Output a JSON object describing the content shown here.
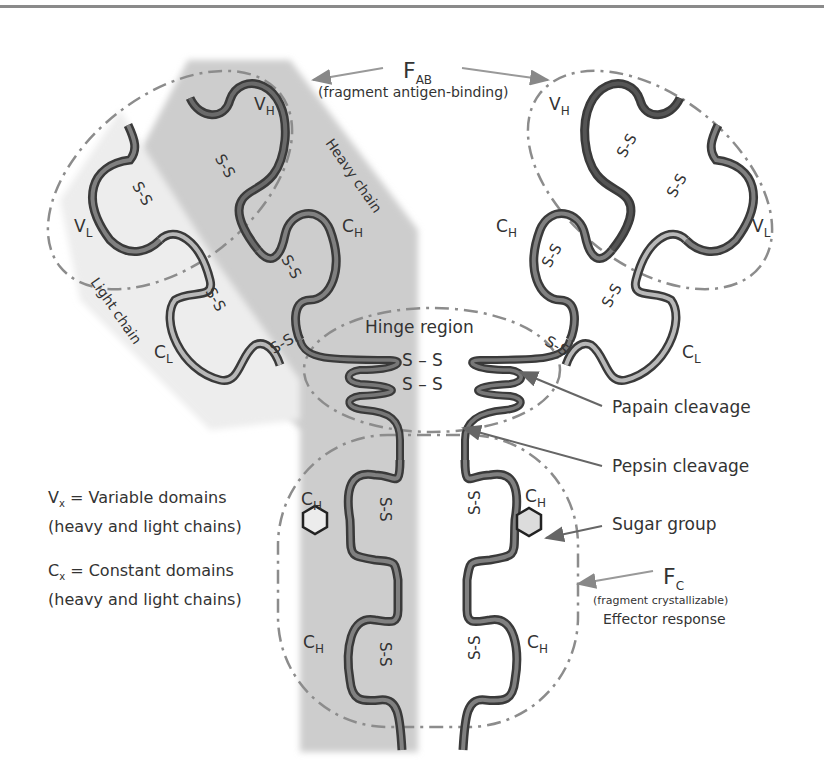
{
  "fab": {
    "label": "F",
    "label_sub": "AB",
    "description": "(fragment antigen-binding)"
  },
  "fc": {
    "label": "F",
    "label_sub": "C",
    "description": "(fragment crystallizable)",
    "role": "Effector response"
  },
  "chains": {
    "heavy": "Heavy chain",
    "light": "Light chain"
  },
  "domains": {
    "vh": {
      "main": "V",
      "sub": "H"
    },
    "vl": {
      "main": "V",
      "sub": "L"
    },
    "ch": {
      "main": "C",
      "sub": "H"
    },
    "cl": {
      "main": "C",
      "sub": "L"
    }
  },
  "hinge": {
    "label": "Hinge region",
    "bond1": "S – S",
    "bond2": "S – S"
  },
  "disulfide": "S-S",
  "callouts": {
    "papain": "Papain cleavage",
    "pepsin": "Pepsin cleavage",
    "sugar": "Sugar group"
  },
  "legend": {
    "variable": {
      "symbol": "V",
      "sub": "x",
      "text": " = Variable domains",
      "detail": "(heavy and light chains)"
    },
    "constant": {
      "symbol": "C",
      "sub": "x",
      "text": " = Constant domains",
      "detail": "(heavy and light chains)"
    }
  },
  "colors": {
    "heavy_chain_fill": "#cfcfcf",
    "chain_dark": "#555555",
    "chain_mid": "#7a7a7a",
    "chain_light": "#b5b5b5",
    "dashed": "#8c8c8c",
    "arrow": "#888888"
  }
}
